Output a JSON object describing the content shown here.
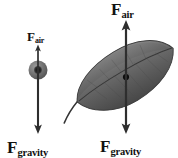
{
  "diagram": {
    "background_color": "#ffffff",
    "ink_color": "#1a1a1a"
  },
  "objects": [
    {
      "name": "ball",
      "shape": "sphere",
      "center_x": 38,
      "center_y": 70,
      "radius": 9,
      "fill_color": "#6b6b6b",
      "core_color": "#1c1c1c"
    },
    {
      "name": "leaf",
      "shape": "leaf",
      "center_x": 126,
      "center_y": 77,
      "tilt_degrees": -27,
      "length": 110,
      "width": 36,
      "fill_color": "#6e6e6e",
      "edge_color": "#3a3a3a",
      "center_dot_color": "#0d0d0d"
    }
  ],
  "vectors": [
    {
      "name": "ball-air-resistance",
      "label_symbol": "F",
      "label_subscript": "air",
      "direction": "up",
      "x": 38,
      "tip_y": 46,
      "tail_y": 70,
      "length": 24,
      "magnitude_relative": "small"
    },
    {
      "name": "ball-gravity",
      "label_symbol": "F",
      "label_subscript": "gravity",
      "direction": "down",
      "x": 38,
      "tail_y": 62,
      "tip_y": 133,
      "length": 71,
      "magnitude_relative": "large"
    },
    {
      "name": "leaf-air-resistance",
      "label_symbol": "F",
      "label_subscript": "air",
      "direction": "up",
      "x": 126,
      "tip_y": 21,
      "tail_y": 77,
      "length": 56,
      "magnitude_relative": "large"
    },
    {
      "name": "leaf-gravity",
      "label_symbol": "F",
      "label_subscript": "gravity",
      "direction": "down",
      "x": 126,
      "tail_y": 77,
      "tip_y": 133,
      "length": 56,
      "magnitude_relative": "large"
    }
  ],
  "labels": {
    "ball_air": {
      "symbol": "F",
      "subscript": "air"
    },
    "ball_gravity": {
      "symbol": "F",
      "subscript": "gravity"
    },
    "leaf_air": {
      "symbol": "F",
      "subscript": "air"
    },
    "leaf_gravity": {
      "symbol": "F",
      "subscript": "gravity"
    }
  }
}
